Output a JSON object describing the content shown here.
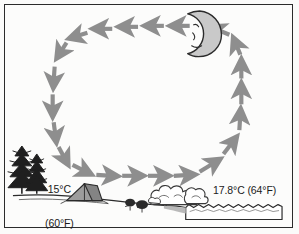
{
  "figure": {
    "type": "land-breeze-circulation-diagram",
    "time_of_day": "night",
    "background_color": "#fbfbfa",
    "frame_color": "#2b2b2b"
  },
  "labels": {
    "land_temp_c": "15°C",
    "land_temp_f": "(60°F)",
    "water_temp": "17.8°C (64°F)"
  },
  "scene": {
    "moon": {
      "name": "crescent-moon",
      "fill": "#c9c9c9",
      "stroke": "#2b2b2b",
      "has_face": true
    },
    "trees": {
      "name": "pine-trees",
      "count": 2,
      "fill": "#1f1f1f"
    },
    "tent": {
      "name": "camping-tent",
      "fill": "#9d9d9d",
      "stroke": "#2b2b2b"
    },
    "water": {
      "name": "lake-water",
      "fill": "#ffffff",
      "surface": "wavy"
    },
    "mist": {
      "name": "mist-clouds",
      "fill": "#ffffff",
      "stroke": "#3a3a3a",
      "puff_count": 5
    },
    "shrubs": {
      "name": "shore-shrubs",
      "fill": "#2b2b2b"
    },
    "shoreline": {
      "name": "ground-line",
      "stroke": "#2b2b2b"
    }
  },
  "circulation": {
    "name": "air-circulation-loop",
    "direction": "counterclockwise",
    "arrow_color": "#8e8e8e",
    "segments": [
      {
        "name": "top-flow",
        "direction": "left",
        "arrow_count": 5
      },
      {
        "name": "left-descending-flow",
        "direction": "down",
        "arrow_count": 5
      },
      {
        "name": "bottom-flow",
        "direction": "right",
        "arrow_count": 5
      },
      {
        "name": "right-ascending-flow",
        "direction": "up",
        "arrow_count": 5
      }
    ]
  }
}
